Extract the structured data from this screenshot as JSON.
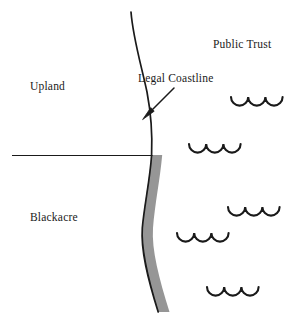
{
  "diagram": {
    "labels": {
      "public_trust": "Public Trust",
      "upland": "Upland",
      "blackacre": "Blackacre",
      "legal_coastline": "Legal Coastline"
    },
    "colors": {
      "ink": "#1a1a1a",
      "shaded_strip": "#969696",
      "background": "#ffffff"
    },
    "elements": {
      "coastline_curve_name": "legal-coastline-curve",
      "shaded_strip_name": "shoreline-shaded-strip",
      "boundary_line_name": "upland-blackacre-boundary-line",
      "arrow_name": "legal-coastline-arrow"
    },
    "waves": [
      {
        "id": "wave-1",
        "x": 231,
        "y": 97
      },
      {
        "id": "wave-2",
        "x": 189,
        "y": 144
      },
      {
        "id": "wave-3",
        "x": 228,
        "y": 207
      },
      {
        "id": "wave-4",
        "x": 177,
        "y": 233
      },
      {
        "id": "wave-5",
        "x": 207,
        "y": 287
      }
    ]
  }
}
